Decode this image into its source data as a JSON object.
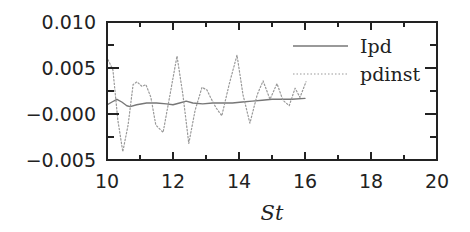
{
  "chart_data": {
    "type": "line",
    "title": "",
    "xlabel": "St",
    "ylabel": "",
    "xlim": [
      10,
      20
    ],
    "ylim": [
      -0.005,
      0.01
    ],
    "x_ticks": [
      10,
      12,
      14,
      16,
      18,
      20
    ],
    "x_tick_labels": [
      "10",
      "12",
      "14",
      "16",
      "18",
      "20"
    ],
    "x_minor_ticks": [
      11,
      13,
      15,
      17,
      19
    ],
    "y_ticks": [
      -0.005,
      0.0,
      0.005,
      0.01
    ],
    "y_tick_labels": [
      "−0.005",
      "−0.000",
      "0.005",
      "0.010"
    ],
    "y_minor_ticks": [
      -0.0025,
      0.0025,
      0.0075
    ],
    "grid": false,
    "legend_position": "upper right",
    "series": [
      {
        "name": "Ipd",
        "style": "solid",
        "color": "#777777",
        "x": [
          10.0,
          10.15,
          10.3,
          10.45,
          10.6,
          10.7,
          10.9,
          11.2,
          11.5,
          11.8,
          12.0,
          12.2,
          12.4,
          12.6,
          12.9,
          13.2,
          13.5,
          13.8,
          14.1,
          14.4,
          14.7,
          15.0,
          15.3,
          15.6,
          16.0
        ],
        "values": [
          0.001,
          0.0013,
          0.0016,
          0.0013,
          0.0009,
          0.0008,
          0.001,
          0.0012,
          0.0012,
          0.0011,
          0.001,
          0.0012,
          0.0014,
          0.0012,
          0.0011,
          0.0012,
          0.0012,
          0.0012,
          0.0013,
          0.0014,
          0.0015,
          0.0016,
          0.0016,
          0.0016,
          0.0017
        ]
      },
      {
        "name": "pdinst",
        "style": "dotted",
        "color": "#999999",
        "x": [
          10.03,
          10.18,
          10.33,
          10.48,
          10.64,
          10.79,
          10.91,
          11.06,
          11.18,
          11.33,
          11.48,
          11.7,
          11.88,
          12.12,
          12.3,
          12.48,
          12.67,
          12.88,
          13.03,
          13.15,
          13.3,
          13.48,
          13.7,
          13.94,
          14.12,
          14.33,
          14.55,
          14.73,
          14.94,
          15.15,
          15.33,
          15.52,
          15.7,
          15.85,
          16.03
        ],
        "values": [
          0.0059,
          0.0048,
          -0.0007,
          -0.0041,
          -0.0012,
          0.0032,
          0.0035,
          0.003,
          0.0032,
          0.0018,
          -0.0012,
          -0.002,
          0.0015,
          0.0063,
          0.0021,
          -0.0032,
          0.0004,
          0.0029,
          0.0026,
          0.0017,
          0.0007,
          -0.0002,
          0.0032,
          0.0064,
          0.0021,
          -0.001,
          0.0021,
          0.0036,
          0.0016,
          0.0033,
          0.0015,
          0.0009,
          0.0028,
          0.0018,
          0.0035
        ]
      }
    ]
  },
  "colors": {
    "axis": "#222222",
    "ipd_line": "#777777",
    "pdinst_line": "#999999"
  }
}
